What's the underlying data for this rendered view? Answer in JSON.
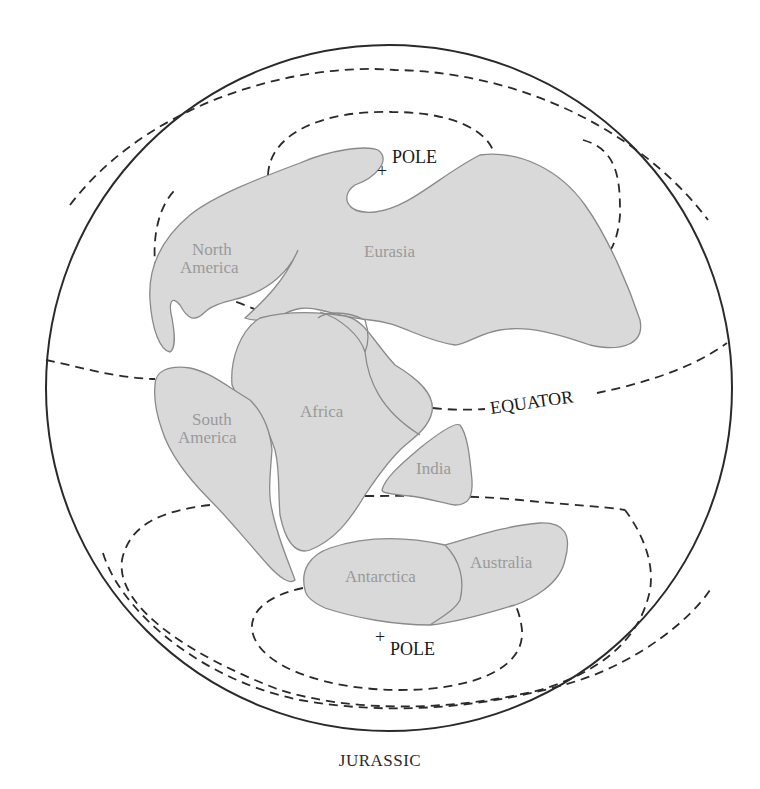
{
  "figure": {
    "caption": "JURASSIC",
    "globe": {
      "center_x": 389,
      "center_y": 388,
      "radius": 343,
      "stroke_color": "#2a2a2a"
    },
    "colors": {
      "land_fill": "#d9d9d9",
      "land_stroke": "#8a8a8a",
      "land_label": "#9a9a9a",
      "line_color": "#2a2a2a"
    },
    "reference_lines": {
      "equator_label": "EQUATOR",
      "north_pole_label": "POLE",
      "south_pole_label": "POLE",
      "pole_marker": "+"
    },
    "continents": [
      {
        "id": "north-america",
        "lines": [
          "North",
          "America"
        ]
      },
      {
        "id": "eurasia",
        "lines": [
          "Eurasia"
        ]
      },
      {
        "id": "south-america",
        "lines": [
          "South",
          "America"
        ]
      },
      {
        "id": "africa",
        "lines": [
          "Africa"
        ]
      },
      {
        "id": "india",
        "lines": [
          "India"
        ]
      },
      {
        "id": "antarctica",
        "lines": [
          "Antarctica"
        ]
      },
      {
        "id": "australia",
        "lines": [
          "Australia"
        ]
      }
    ]
  }
}
